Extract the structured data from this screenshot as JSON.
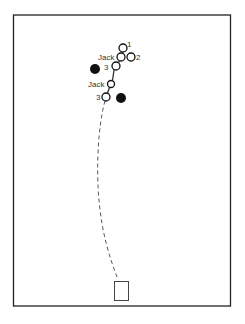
{
  "diagram": {
    "type": "bowls-delivery-diagram",
    "frame": {
      "x": 13,
      "y": 15,
      "w": 217,
      "h": 291,
      "stroke": "#222222"
    },
    "mat": {
      "x": 114,
      "y": 281,
      "w": 14,
      "h": 19
    },
    "labels": {
      "bowl_1": "1",
      "bowl_2": "2",
      "bowl_3_upper": "3",
      "bowl_3_lower": "3",
      "jack_upper": "Jack",
      "jack_lower": "Jack"
    },
    "open_circles": [
      {
        "id": "bowl-1",
        "cx": 123,
        "cy": 48,
        "r": 4
      },
      {
        "id": "jack-upper",
        "cx": 121,
        "cy": 57,
        "r": 4
      },
      {
        "id": "bowl-2",
        "cx": 131,
        "cy": 57,
        "r": 4
      },
      {
        "id": "bowl-3-upper",
        "cx": 116,
        "cy": 66,
        "r": 4
      },
      {
        "id": "jack-lower",
        "cx": 111,
        "cy": 84,
        "r": 3.5
      },
      {
        "id": "bowl-3-lower",
        "cx": 106,
        "cy": 97,
        "r": 4
      }
    ],
    "filled_circles": [
      {
        "id": "opponent-bowl-left",
        "cx": 95,
        "cy": 69,
        "r": 5
      },
      {
        "id": "opponent-bowl-right",
        "cx": 121,
        "cy": 98,
        "r": 5
      }
    ],
    "colors": {
      "ink": "#111111",
      "line": "#333333",
      "background": "#ffffff"
    }
  }
}
